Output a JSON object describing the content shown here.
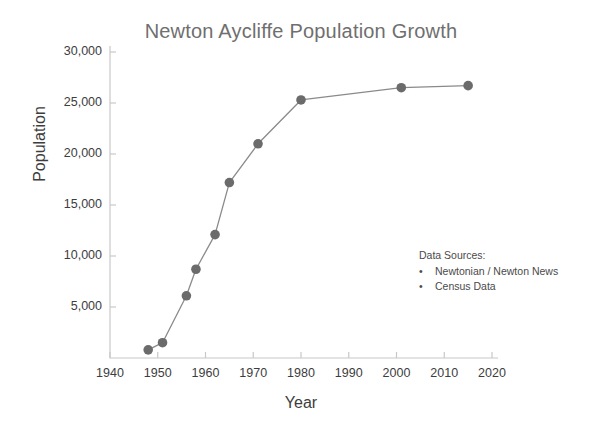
{
  "chart_data": {
    "type": "line",
    "title": "Newton Aycliffe Population Growth",
    "xlabel": "Year",
    "ylabel": "Population",
    "xlim": [
      1940,
      2020
    ],
    "ylim": [
      0,
      30000
    ],
    "grid": false,
    "legend_position": "none",
    "xticks": [
      "1940",
      "1950",
      "1960",
      "1970",
      "1980",
      "1990",
      "2000",
      "2010",
      "2020"
    ],
    "xtick_values": [
      1940,
      1950,
      1960,
      1970,
      1980,
      1990,
      2000,
      2010,
      2020
    ],
    "yticks": [
      "5,000",
      "10,000",
      "15,000",
      "20,000",
      "25,000",
      "30,000"
    ],
    "ytick_values": [
      5000,
      10000,
      15000,
      20000,
      25000,
      30000
    ],
    "series": [
      {
        "name": "Population",
        "marker": "circle",
        "color": "#6b6b6b",
        "line_color": "#8a8a8a",
        "x": [
          1948,
          1951,
          1956,
          1958,
          1962,
          1965,
          1971,
          1980,
          2001,
          2015
        ],
        "values": [
          800,
          1500,
          6100,
          8700,
          12100,
          17200,
          21000,
          25300,
          26500,
          26700
        ]
      }
    ],
    "annotations": {
      "title": "Data Sources:",
      "bullet": "•",
      "items": [
        "Newtonian / Newton News",
        "Census Data"
      ]
    }
  },
  "colors": {
    "marker": "#6b6b6b",
    "line": "#8a8a8a",
    "axis": "#c8c8c8",
    "title_text": "#6f6f6f",
    "label_text": "#3d3d3d",
    "background": "#ffffff"
  }
}
